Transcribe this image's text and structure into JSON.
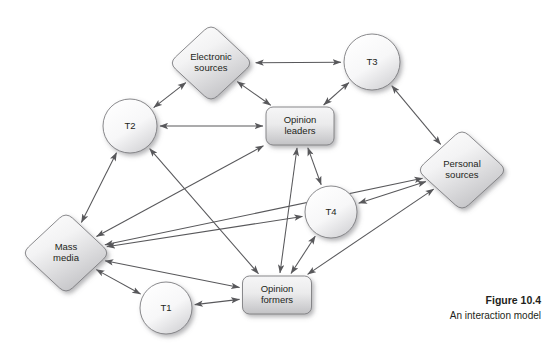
{
  "figure": {
    "number": "Figure 10.4",
    "caption": "An interaction model",
    "background": "#ffffff"
  },
  "style": {
    "edge_color": "#58585b",
    "node_stroke": "#7d7d80",
    "node_fill_light": "#ffffff",
    "node_fill_dark": "#c9c9cb",
    "text_color": "#231f20"
  },
  "diagram": {
    "type": "node-link-diagram",
    "nodes": [
      {
        "id": "electronic_sources",
        "label_lines": [
          "Electronic",
          "sources"
        ],
        "shape": "diamond",
        "cx": 211,
        "cy": 63,
        "rx": 42,
        "ry": 39
      },
      {
        "id": "t3",
        "label_lines": [
          "T3"
        ],
        "shape": "circle",
        "cx": 372,
        "cy": 62,
        "r": 28
      },
      {
        "id": "t2",
        "label_lines": [
          "T2"
        ],
        "shape": "circle",
        "cx": 130,
        "cy": 126,
        "r": 27
      },
      {
        "id": "opinion_leaders",
        "label_lines": [
          "Opinion",
          "leaders"
        ],
        "shape": "rounded-rect",
        "cx": 300,
        "cy": 126,
        "w": 68,
        "h": 38
      },
      {
        "id": "personal_sources",
        "label_lines": [
          "Personal",
          "sources"
        ],
        "shape": "diamond",
        "cx": 462,
        "cy": 170,
        "rx": 45,
        "ry": 41
      },
      {
        "id": "t4",
        "label_lines": [
          "T4"
        ],
        "shape": "circle",
        "cx": 331,
        "cy": 212,
        "r": 26
      },
      {
        "id": "mass_media",
        "label_lines": [
          "Mass",
          "media"
        ],
        "shape": "diamond",
        "cx": 66,
        "cy": 253,
        "rx": 44,
        "ry": 41
      },
      {
        "id": "opinion_formers",
        "label_lines": [
          "Opinion",
          "formers"
        ],
        "shape": "rounded-rect",
        "cx": 277,
        "cy": 295,
        "w": 69,
        "h": 38
      },
      {
        "id": "t1",
        "label_lines": [
          "T1"
        ],
        "shape": "circle",
        "cx": 166,
        "cy": 308,
        "r": 26
      }
    ],
    "edges": [
      {
        "from": "electronic_sources",
        "to": "t3",
        "arrows": "both"
      },
      {
        "from": "electronic_sources",
        "to": "t2",
        "arrows": "both"
      },
      {
        "from": "electronic_sources",
        "to": "opinion_leaders",
        "arrows": "both"
      },
      {
        "from": "t3",
        "to": "opinion_leaders",
        "arrows": "both"
      },
      {
        "from": "t3",
        "to": "personal_sources",
        "arrows": "both"
      },
      {
        "from": "t2",
        "to": "opinion_leaders",
        "arrows": "both"
      },
      {
        "from": "t2",
        "to": "mass_media",
        "arrows": "both"
      },
      {
        "from": "t2",
        "to": "opinion_formers",
        "arrows": "both"
      },
      {
        "from": "opinion_leaders",
        "to": "t4",
        "arrows": "both"
      },
      {
        "from": "opinion_leaders",
        "to": "mass_media",
        "arrows": "both"
      },
      {
        "from": "opinion_leaders",
        "to": "opinion_formers",
        "arrows": "both"
      },
      {
        "from": "personal_sources",
        "to": "t4",
        "arrows": "both"
      },
      {
        "from": "personal_sources",
        "to": "opinion_formers",
        "arrows": "both"
      },
      {
        "from": "personal_sources",
        "to": "mass_media",
        "arrows": "both"
      },
      {
        "from": "t4",
        "to": "opinion_formers",
        "arrows": "both"
      },
      {
        "from": "t4",
        "to": "mass_media",
        "arrows": "both"
      },
      {
        "from": "mass_media",
        "to": "t1",
        "arrows": "both"
      },
      {
        "from": "mass_media",
        "to": "opinion_formers",
        "arrows": "both"
      },
      {
        "from": "t1",
        "to": "opinion_formers",
        "arrows": "both"
      }
    ]
  }
}
